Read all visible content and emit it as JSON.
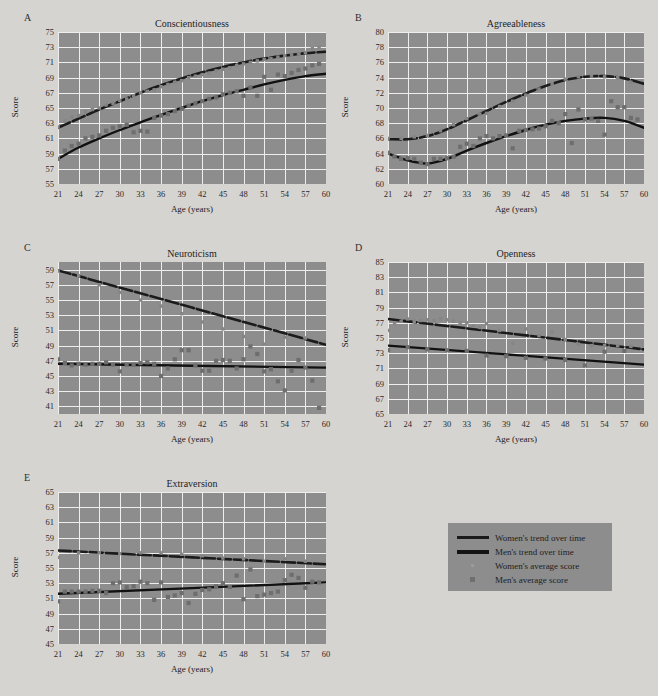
{
  "figure": {
    "background_color": "#d6d4d1",
    "plot_background_color": "#8d8d8d",
    "grid_color": "#efeeec",
    "axis_label_x": "Age (years)",
    "axis_label_y": "Score"
  },
  "legend": {
    "items": [
      {
        "key": "women-trend",
        "label": "Women's trend over time",
        "marker": "thick-line",
        "color": "#1a1a1a"
      },
      {
        "key": "men-trend",
        "label": "Men's trend over time",
        "marker": "thick-line",
        "color": "#141414"
      },
      {
        "key": "women-avg",
        "label": "Women's average score",
        "marker": "small-dot",
        "color": "#9b9b9b"
      },
      {
        "key": "men-avg",
        "label": "Men's average score",
        "marker": "square",
        "color": "#6f6f6f"
      }
    ]
  },
  "chart_data": [
    {
      "panel": "A",
      "type": "scatter",
      "title": "Conscientiousness",
      "xlabel": "Age (years)",
      "ylabel": "Score",
      "xlim": [
        21,
        60
      ],
      "ylim": [
        55,
        75
      ],
      "xticks": [
        21,
        24,
        27,
        30,
        33,
        36,
        39,
        42,
        45,
        48,
        51,
        54,
        57,
        60
      ],
      "yticks": [
        55,
        57,
        59,
        61,
        63,
        65,
        67,
        69,
        71,
        73,
        75
      ],
      "grid": true,
      "legend_position": "external-bottom-right",
      "series": [
        {
          "name": "Women's trend over time",
          "style": "trend-line",
          "x": [
            21,
            24,
            27,
            30,
            33,
            36,
            39,
            42,
            45,
            48,
            51,
            54,
            57,
            60
          ],
          "values": [
            62.4,
            63.6,
            64.8,
            65.9,
            67.0,
            68.0,
            68.9,
            69.7,
            70.4,
            71.0,
            71.5,
            71.9,
            72.2,
            72.4
          ]
        },
        {
          "name": "Men's trend over time",
          "style": "trend-line",
          "x": [
            21,
            24,
            27,
            30,
            33,
            36,
            39,
            42,
            45,
            48,
            51,
            54,
            57,
            60
          ],
          "values": [
            58.3,
            59.8,
            61.0,
            62.1,
            63.1,
            64.1,
            65.0,
            65.9,
            66.7,
            67.4,
            68.1,
            68.7,
            69.2,
            69.5
          ]
        },
        {
          "name": "Women's average score",
          "style": "points",
          "x": [
            21,
            22,
            23,
            24,
            25,
            26,
            27,
            28,
            29,
            30,
            31,
            32,
            33,
            34,
            35,
            36,
            37,
            38,
            39,
            40,
            41,
            42,
            43,
            44,
            45,
            46,
            47,
            48,
            49,
            50,
            51,
            52,
            53,
            54,
            55,
            56,
            57,
            58,
            59
          ],
          "values": [
            62.5,
            63.3,
            63.8,
            64.0,
            64.5,
            64.8,
            65.0,
            65.4,
            65.6,
            66.0,
            66.2,
            66.6,
            67.0,
            67.2,
            67.4,
            67.8,
            68.1,
            68.4,
            68.6,
            69.0,
            69.2,
            69.4,
            69.6,
            69.9,
            70.1,
            70.3,
            70.6,
            70.8,
            71.0,
            71.2,
            71.4,
            71.5,
            71.7,
            71.9,
            72.0,
            72.1,
            72.3,
            72.8,
            73.0
          ]
        },
        {
          "name": "Men's average score",
          "style": "points",
          "x": [
            21,
            22,
            23,
            24,
            25,
            26,
            27,
            28,
            29,
            30,
            31,
            32,
            33,
            34,
            35,
            36,
            37,
            38,
            39,
            40,
            41,
            42,
            43,
            44,
            45,
            46,
            47,
            48,
            49,
            50,
            51,
            52,
            53,
            54,
            55,
            56,
            57,
            58,
            59
          ],
          "values": [
            58.3,
            59.4,
            60.0,
            60.3,
            61.0,
            61.2,
            61.4,
            62.0,
            62.4,
            62.6,
            62.8,
            61.8,
            62.0,
            61.9,
            63.7,
            64.0,
            64.2,
            64.6,
            64.9,
            65.3,
            65.6,
            65.9,
            66.2,
            66.4,
            66.8,
            67.0,
            67.2,
            66.6,
            67.7,
            66.6,
            69.1,
            67.4,
            69.4,
            69.2,
            69.6,
            70.0,
            70.2,
            70.6,
            70.8
          ]
        }
      ]
    },
    {
      "panel": "B",
      "type": "scatter",
      "title": "Agreeableness",
      "xlabel": "Age (years)",
      "ylabel": "Score",
      "xlim": [
        21,
        60
      ],
      "ylim": [
        60,
        80
      ],
      "xticks": [
        21,
        24,
        27,
        30,
        33,
        36,
        39,
        42,
        45,
        48,
        51,
        54,
        57,
        60
      ],
      "yticks": [
        60,
        62,
        64,
        66,
        68,
        70,
        72,
        74,
        76,
        78,
        80
      ],
      "grid": true,
      "series": [
        {
          "name": "Women's trend over time",
          "style": "trend-line",
          "x": [
            21,
            24,
            27,
            30,
            33,
            36,
            39,
            42,
            45,
            48,
            51,
            54,
            57,
            60
          ],
          "values": [
            65.9,
            65.9,
            66.3,
            67.2,
            68.4,
            69.6,
            70.8,
            71.9,
            72.9,
            73.7,
            74.1,
            74.2,
            73.9,
            73.2
          ]
        },
        {
          "name": "Men's trend over time",
          "style": "trend-line",
          "x": [
            21,
            24,
            27,
            30,
            33,
            36,
            39,
            42,
            45,
            48,
            51,
            54,
            57,
            60
          ],
          "values": [
            64.0,
            63.1,
            62.7,
            63.3,
            64.4,
            65.4,
            66.3,
            67.1,
            67.8,
            68.3,
            68.6,
            68.7,
            68.3,
            67.4
          ]
        },
        {
          "name": "Women's average score",
          "style": "points",
          "x": [
            21,
            23,
            25,
            27,
            29,
            31,
            33,
            35,
            36,
            38,
            40,
            42,
            44,
            46,
            48,
            50,
            52,
            54,
            56,
            58
          ],
          "values": [
            66.0,
            66.0,
            66.2,
            66.4,
            67.0,
            67.8,
            68.6,
            69.2,
            69.3,
            70.2,
            70.9,
            71.7,
            72.5,
            73.2,
            73.8,
            74.1,
            74.2,
            74.1,
            74.0,
            73.4
          ]
        },
        {
          "name": "Men's average score",
          "style": "points",
          "x": [
            21,
            22,
            23,
            24,
            25,
            26,
            27,
            28,
            29,
            30,
            31,
            32,
            33,
            34,
            35,
            36,
            37,
            38,
            39,
            40,
            41,
            42,
            43,
            44,
            45,
            46,
            47,
            48,
            49,
            50,
            51,
            52,
            53,
            54,
            55,
            56,
            57,
            58,
            59
          ],
          "values": [
            64.1,
            63.6,
            63.3,
            63.4,
            63.3,
            62.8,
            62.6,
            63.3,
            63.3,
            63.4,
            63.6,
            64.9,
            65.3,
            65.0,
            66.0,
            66.3,
            66.0,
            66.3,
            66.4,
            64.7,
            67.0,
            67.1,
            67.2,
            67.3,
            67.6,
            68.3,
            68.0,
            69.2,
            65.4,
            69.8,
            68.5,
            68.6,
            68.3,
            66.5,
            70.9,
            70.1,
            70.1,
            68.7,
            68.5
          ]
        }
      ]
    },
    {
      "panel": "C",
      "type": "scatter",
      "title": "Neuroticism",
      "xlabel": "Age (years)",
      "ylabel": "Score",
      "xlim": [
        21,
        60
      ],
      "ylim": [
        40,
        60
      ],
      "xticks": [
        21,
        24,
        27,
        30,
        33,
        36,
        39,
        42,
        45,
        48,
        51,
        54,
        57,
        60
      ],
      "yticks": [
        41,
        43,
        45,
        47,
        49,
        51,
        53,
        55,
        57,
        59
      ],
      "grid": true,
      "series": [
        {
          "name": "Women's trend over time",
          "style": "trend-line",
          "x": [
            21,
            60
          ],
          "values": [
            58.9,
            49.1
          ]
        },
        {
          "name": "Men's trend over time",
          "style": "trend-line",
          "x": [
            21,
            60
          ],
          "values": [
            46.6,
            46.1
          ]
        },
        {
          "name": "Women's average score",
          "style": "points",
          "x": [
            21,
            24,
            27,
            30,
            33,
            36,
            39,
            42,
            45,
            48,
            51,
            54,
            57
          ],
          "values": [
            58.8,
            58.2,
            57.0,
            56.0,
            55.0,
            54.2,
            53.2,
            52.1,
            51.2,
            50.2,
            49.2,
            50.1,
            50.0
          ]
        },
        {
          "name": "Men's average score",
          "style": "points",
          "x": [
            21,
            22,
            23,
            24,
            25,
            26,
            27,
            28,
            29,
            30,
            31,
            32,
            33,
            34,
            35,
            36,
            37,
            38,
            39,
            40,
            41,
            42,
            43,
            44,
            45,
            46,
            47,
            48,
            49,
            50,
            51,
            52,
            53,
            54,
            55,
            56,
            57,
            58,
            59
          ],
          "values": [
            47.2,
            46.7,
            46.4,
            46.6,
            46.5,
            46.6,
            46.6,
            46.8,
            46.5,
            45.6,
            46.5,
            46.5,
            46.7,
            46.8,
            46.6,
            45.0,
            46.0,
            47.2,
            48.4,
            48.4,
            46.4,
            45.7,
            45.7,
            47.0,
            47.1,
            47.0,
            46.0,
            47.2,
            48.9,
            47.9,
            45.6,
            45.9,
            44.3,
            43.1,
            45.7,
            47.1,
            46.1,
            44.4,
            40.8
          ]
        }
      ]
    },
    {
      "panel": "D",
      "type": "scatter",
      "title": "Openness",
      "xlabel": "Age (years)",
      "ylabel": "Score",
      "xlim": [
        21,
        60
      ],
      "ylim": [
        65,
        85
      ],
      "xticks": [
        21,
        24,
        27,
        30,
        33,
        36,
        39,
        42,
        45,
        48,
        51,
        54,
        57,
        60
      ],
      "yticks": [
        65,
        67,
        69,
        71,
        73,
        75,
        77,
        79,
        81,
        83,
        85
      ],
      "grid": true,
      "series": [
        {
          "name": "Women's trend over time",
          "style": "trend-line",
          "x": [
            21,
            60
          ],
          "values": [
            77.5,
            73.5
          ]
        },
        {
          "name": "Men's trend over time",
          "style": "trend-line",
          "x": [
            21,
            60
          ],
          "values": [
            74.0,
            71.5
          ]
        },
        {
          "name": "Women's average score",
          "style": "points",
          "x": [
            21,
            22,
            23,
            24,
            25,
            26,
            27,
            28,
            29,
            30,
            31,
            32,
            33,
            34,
            35,
            36,
            38,
            40,
            42,
            44,
            46,
            48,
            50,
            52,
            54,
            56,
            58
          ],
          "values": [
            76.0,
            77.0,
            77.2,
            77.5,
            77.2,
            77.3,
            77.4,
            77.3,
            77.5,
            77.4,
            77.2,
            77.0,
            77.0,
            76.6,
            76.4,
            76.9,
            76.0,
            74.3,
            76.2,
            75.3,
            75.8,
            74.8,
            74.2,
            74.0,
            74.0,
            74.0,
            73.9
          ]
        },
        {
          "name": "Men's average score",
          "style": "points",
          "x": [
            21,
            24,
            27,
            30,
            33,
            36,
            39,
            42,
            45,
            48,
            51,
            54,
            57
          ],
          "values": [
            73.4,
            73.8,
            73.5,
            73.4,
            73.3,
            72.7,
            72.6,
            72.4,
            72.3,
            72.1,
            71.4,
            73.2,
            73.3
          ]
        }
      ]
    },
    {
      "panel": "E",
      "type": "scatter",
      "title": "Extraversion",
      "xlabel": "Age (years)",
      "ylabel": "Score",
      "xlim": [
        21,
        60
      ],
      "ylim": [
        45,
        65
      ],
      "xticks": [
        21,
        24,
        27,
        30,
        33,
        36,
        39,
        42,
        45,
        48,
        51,
        54,
        57,
        60
      ],
      "yticks": [
        45,
        47,
        49,
        51,
        53,
        55,
        57,
        59,
        61,
        63,
        65
      ],
      "grid": true,
      "series": [
        {
          "name": "Women's trend over time",
          "style": "trend-line",
          "x": [
            21,
            60
          ],
          "values": [
            57.3,
            55.5
          ]
        },
        {
          "name": "Men's trend over time",
          "style": "trend-line",
          "x": [
            21,
            60
          ],
          "values": [
            51.6,
            53.1
          ]
        },
        {
          "name": "Women's average score",
          "style": "points",
          "x": [
            21,
            24,
            27,
            30,
            33,
            36,
            39,
            42,
            45,
            48,
            51,
            54,
            57
          ],
          "values": [
            56.4,
            57.0,
            57.0,
            56.9,
            57.0,
            57.0,
            56.8,
            56.6,
            56.3,
            56.2,
            55.9,
            56.2,
            55.9
          ]
        },
        {
          "name": "Men's average score",
          "style": "points",
          "x": [
            21,
            22,
            23,
            24,
            25,
            26,
            27,
            28,
            29,
            30,
            31,
            32,
            33,
            34,
            35,
            36,
            37,
            38,
            39,
            40,
            41,
            42,
            43,
            44,
            45,
            46,
            47,
            48,
            49,
            50,
            51,
            52,
            53,
            54,
            55,
            56,
            57,
            58,
            59
          ],
          "values": [
            50.6,
            51.9,
            51.9,
            51.9,
            51.9,
            52.0,
            52.0,
            51.7,
            53.0,
            53.1,
            52.5,
            52.6,
            53.2,
            53.0,
            50.8,
            53.1,
            51.2,
            51.4,
            51.7,
            50.4,
            51.6,
            52.1,
            52.2,
            52.6,
            53.0,
            52.5,
            54.0,
            50.9,
            54.8,
            51.3,
            51.5,
            51.7,
            51.9,
            53.4,
            54.1,
            53.7,
            52.4,
            53.2,
            53.1
          ]
        }
      ]
    }
  ]
}
